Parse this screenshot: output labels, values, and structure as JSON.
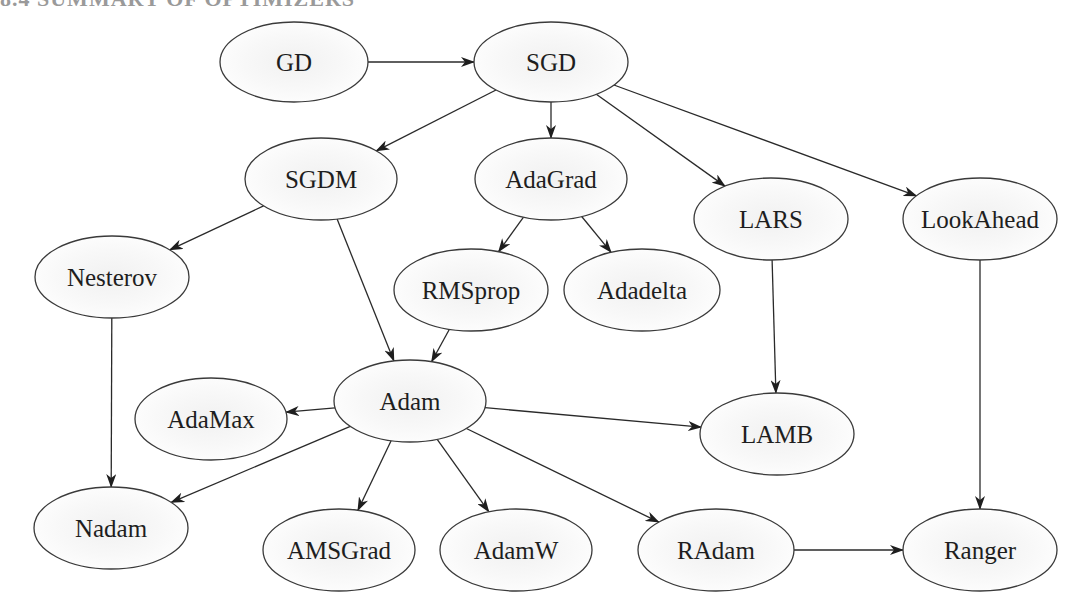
{
  "figure": {
    "title_clipped": "8.4  SUMMARY OF OPTIMIZERS",
    "stroke_color": "#2a2a2a",
    "fill_color": "#f7f7f7"
  },
  "nodes": [
    {
      "id": "GD",
      "label": "GD",
      "cx": 294,
      "cy": 62,
      "rx": 74,
      "ry": 40
    },
    {
      "id": "SGD",
      "label": "SGD",
      "cx": 551,
      "cy": 62,
      "rx": 77,
      "ry": 40
    },
    {
      "id": "SGDM",
      "label": "SGDM",
      "cx": 321,
      "cy": 179,
      "rx": 76,
      "ry": 41
    },
    {
      "id": "AdaGrad",
      "label": "AdaGrad",
      "cx": 551,
      "cy": 179,
      "rx": 76,
      "ry": 41
    },
    {
      "id": "LARS",
      "label": "LARS",
      "cx": 771,
      "cy": 219,
      "rx": 77,
      "ry": 41
    },
    {
      "id": "LookAhead",
      "label": "LookAhead",
      "cx": 980,
      "cy": 219,
      "rx": 77,
      "ry": 41
    },
    {
      "id": "Nesterov",
      "label": "Nesterov",
      "cx": 112,
      "cy": 277,
      "rx": 77,
      "ry": 41
    },
    {
      "id": "RMSprop",
      "label": "RMSprop",
      "cx": 471,
      "cy": 290,
      "rx": 77,
      "ry": 41
    },
    {
      "id": "Adadelta",
      "label": "Adadelta",
      "cx": 642,
      "cy": 290,
      "rx": 78,
      "ry": 41
    },
    {
      "id": "Adam",
      "label": "Adam",
      "cx": 410,
      "cy": 401,
      "rx": 76,
      "ry": 41
    },
    {
      "id": "AdaMax",
      "label": "AdaMax",
      "cx": 211,
      "cy": 419,
      "rx": 76,
      "ry": 41
    },
    {
      "id": "LAMB",
      "label": "LAMB",
      "cx": 777,
      "cy": 434,
      "rx": 77,
      "ry": 41
    },
    {
      "id": "Nadam",
      "label": "Nadam",
      "cx": 111,
      "cy": 528,
      "rx": 77,
      "ry": 41
    },
    {
      "id": "AMSGrad",
      "label": "AMSGrad",
      "cx": 339,
      "cy": 550,
      "rx": 76,
      "ry": 41
    },
    {
      "id": "AdamW",
      "label": "AdamW",
      "cx": 516,
      "cy": 550,
      "rx": 76,
      "ry": 41
    },
    {
      "id": "RAdam",
      "label": "RAdam",
      "cx": 716,
      "cy": 550,
      "rx": 78,
      "ry": 41
    },
    {
      "id": "Ranger",
      "label": "Ranger",
      "cx": 980,
      "cy": 550,
      "rx": 77,
      "ry": 41
    }
  ],
  "edges": [
    {
      "from": "GD",
      "to": "SGD"
    },
    {
      "from": "SGD",
      "to": "SGDM"
    },
    {
      "from": "SGD",
      "to": "AdaGrad"
    },
    {
      "from": "SGD",
      "to": "LARS"
    },
    {
      "from": "SGD",
      "to": "LookAhead"
    },
    {
      "from": "SGDM",
      "to": "Nesterov"
    },
    {
      "from": "SGDM",
      "to": "Adam"
    },
    {
      "from": "AdaGrad",
      "to": "RMSprop"
    },
    {
      "from": "AdaGrad",
      "to": "Adadelta"
    },
    {
      "from": "RMSprop",
      "to": "Adam"
    },
    {
      "from": "LARS",
      "to": "LAMB"
    },
    {
      "from": "LookAhead",
      "to": "Ranger"
    },
    {
      "from": "Nesterov",
      "to": "Nadam"
    },
    {
      "from": "Adam",
      "to": "AdaMax"
    },
    {
      "from": "Adam",
      "to": "LAMB"
    },
    {
      "from": "Adam",
      "to": "Nadam"
    },
    {
      "from": "Adam",
      "to": "AMSGrad"
    },
    {
      "from": "Adam",
      "to": "AdamW"
    },
    {
      "from": "Adam",
      "to": "RAdam"
    },
    {
      "from": "RAdam",
      "to": "Ranger"
    }
  ]
}
